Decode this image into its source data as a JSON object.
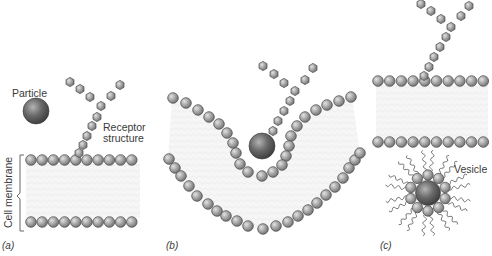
{
  "figure": {
    "panels": [
      {
        "id": "a",
        "label": "(a)"
      },
      {
        "id": "b",
        "label": "(b)"
      },
      {
        "id": "c",
        "label": "(c)"
      }
    ],
    "labels": {
      "particle": "Particle",
      "receptor_line1": "Receptor",
      "receptor_line2": "structure",
      "cell_membrane": "Cell membrane",
      "vesicle": "Vesicle"
    },
    "colors": {
      "background": "#ffffff",
      "lipid_head": "#9a9a9a",
      "lipid_head_highlight": "#d8d8d8",
      "particle": "#5a5a5a",
      "particle_highlight": "#a8a8a8",
      "membrane_interior": "#f2f2f2",
      "text": "#3a3a3a"
    }
  }
}
